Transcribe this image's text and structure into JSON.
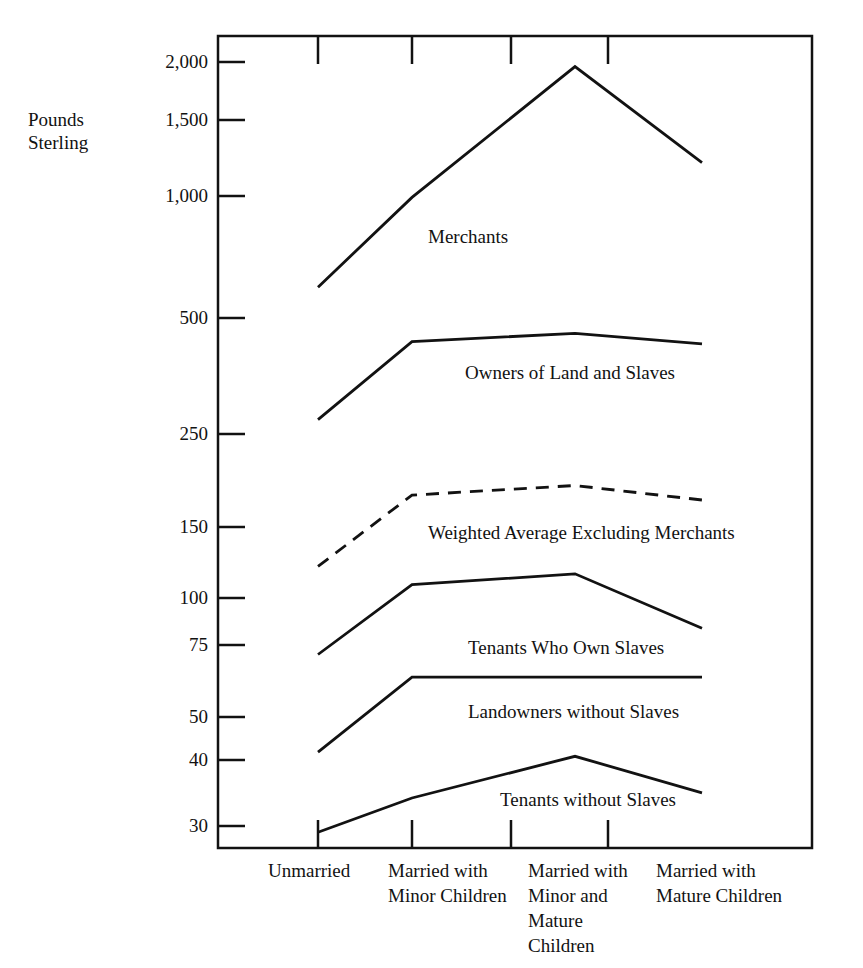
{
  "chart_data": {
    "type": "line",
    "title": "",
    "subtitle": "",
    "xlabel": "",
    "ylabel": "Pounds Sterling",
    "ylabel_lines": [
      "Pounds",
      "Sterling"
    ],
    "yscale": "log",
    "ylim": [
      28,
      2200
    ],
    "grid": false,
    "legend_position": "inline-labels",
    "categories": [
      "Unmarried",
      "Married with Minor Children",
      "Married with Minor and Mature Children",
      "Married with Mature Children"
    ],
    "category_label_lines": [
      [
        "Unmarried"
      ],
      [
        "Married with",
        "Minor Children"
      ],
      [
        "Married with",
        "Minor and",
        "Mature",
        "Children"
      ],
      [
        "Married with",
        "Mature Children"
      ]
    ],
    "yticks": [
      30,
      40,
      50,
      75,
      100,
      150,
      250,
      500,
      1000,
      1500,
      2000
    ],
    "ytick_labels": [
      "30",
      "40",
      "50",
      "75",
      "100",
      "150",
      "250",
      "500",
      "1,000",
      "1,500",
      "2,000"
    ],
    "series": [
      {
        "name": "Merchants",
        "style": "solid",
        "values": [
          580,
          950,
          1950,
          1150
        ]
      },
      {
        "name": "Owners of Land and Slaves",
        "style": "solid",
        "values": [
          280,
          430,
          450,
          425
        ]
      },
      {
        "name": "Weighted Average Excluding Merchants",
        "style": "dashed",
        "values": [
          125,
          185,
          195,
          180
        ]
      },
      {
        "name": "Tenants Who Own Slaves",
        "style": "solid",
        "values": [
          77,
          113,
          120,
          89
        ]
      },
      {
        "name": "Landowners without Slaves",
        "style": "solid",
        "values": [
          45,
          68,
          68,
          68
        ]
      },
      {
        "name": "Tenants without Slaves",
        "style": "solid",
        "values": [
          29,
          35,
          44,
          36
        ]
      }
    ],
    "colors": {
      "line": "#121212",
      "axis": "#121212",
      "background": "#ffffff"
    }
  },
  "annotations": {
    "merchants_label": "Merchants",
    "owners_label": "Owners of Land and Slaves",
    "weighted_label": "Weighted Average Excluding Merchants",
    "tenants_own_label": "Tenants Who Own Slaves",
    "landowners_label": "Landowners without Slaves",
    "tenants_without_label": "Tenants without Slaves"
  },
  "ytick_texts": {
    "t2000": "2,000",
    "t1500": "1,500",
    "t1000": "1,000",
    "t500": "500",
    "t250": "250",
    "t150": "150",
    "t100": "100",
    "t75": "75",
    "t50": "50",
    "t40": "40",
    "t30": "30"
  },
  "xcat_texts": {
    "c1l1": "Unmarried",
    "c2l1": "Married with",
    "c2l2": "Minor Children",
    "c3l1": "Married with",
    "c3l2": "Minor and",
    "c3l3": "Mature",
    "c3l4": "Children",
    "c4l1": "Married with",
    "c4l2": "Mature Children"
  },
  "ylabel_texts": {
    "line1": "Pounds",
    "line2": "Sterling"
  }
}
